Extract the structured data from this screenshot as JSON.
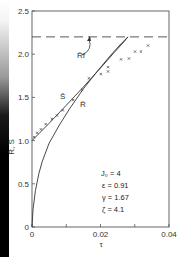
{
  "chart_data": {
    "type": "line",
    "title": "",
    "xlabel": "τ",
    "ylabel": "R̄, S̄",
    "xlim": [
      0,
      0.04
    ],
    "ylim": [
      0,
      2.5
    ],
    "x_ticks": [
      {
        "value": 0,
        "label": "0"
      },
      {
        "value": 0.01,
        "label": ""
      },
      {
        "value": 0.02,
        "label": "0.02"
      },
      {
        "value": 0.03,
        "label": ""
      },
      {
        "value": 0.04,
        "label": "0.04"
      }
    ],
    "y_ticks": [
      {
        "value": 0,
        "label": "0"
      },
      {
        "value": 0.5,
        "label": "0.5"
      },
      {
        "value": 1.0,
        "label": "1.0"
      },
      {
        "value": 1.5,
        "label": "1.5"
      },
      {
        "value": 2.0,
        "label": "2.0"
      },
      {
        "value": 2.5,
        "label": "2.5"
      }
    ],
    "grid": false,
    "series": [
      {
        "name": "S̄",
        "style": "solid",
        "x": [
          0,
          0.005,
          0.01,
          0.015,
          0.02,
          0.024,
          0.027,
          0.028
        ],
        "y": [
          1.0,
          1.2,
          1.41,
          1.62,
          1.84,
          2.02,
          2.15,
          2.2
        ]
      },
      {
        "name": "R̄",
        "style": "solid",
        "x": [
          0,
          0.0003,
          0.001,
          0.002,
          0.003,
          0.005,
          0.008,
          0.011,
          0.015,
          0.019,
          0.023,
          0.026,
          0.0275,
          0.028
        ],
        "y": [
          0,
          0.2,
          0.42,
          0.62,
          0.76,
          0.97,
          1.18,
          1.37,
          1.6,
          1.8,
          1.99,
          2.12,
          2.18,
          2.2
        ]
      },
      {
        "name": "R̄f",
        "style": "dashed",
        "x": [
          0,
          0.04
        ],
        "y": [
          2.2,
          2.2
        ]
      },
      {
        "name": "experimental",
        "style": "markers",
        "marker": "x",
        "x": [
          0.0006,
          0.0015,
          0.0026,
          0.004,
          0.0058,
          0.0073,
          0.009,
          0.012,
          0.0146,
          0.0166,
          0.0201,
          0.0222,
          0.0222,
          0.026,
          0.0283,
          0.0301,
          0.0318,
          0.0339
        ],
        "y": [
          1.04,
          1.09,
          1.13,
          1.19,
          1.25,
          1.29,
          1.35,
          1.47,
          1.59,
          1.72,
          1.77,
          1.8,
          1.85,
          1.94,
          1.95,
          2.03,
          2.03,
          2.1
        ]
      }
    ],
    "annotations": [
      {
        "text": "R̄f",
        "points_to": "dashed line"
      },
      {
        "text": "S̄"
      },
      {
        "text": "R̄"
      }
    ],
    "parameters": [
      "J₀ = 4",
      "ε = 0.91",
      "γ = 1.67",
      "ζ = 4.1"
    ]
  }
}
